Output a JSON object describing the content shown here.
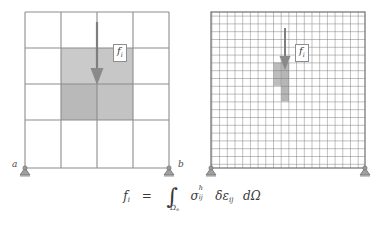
{
  "figure": {
    "panels": [
      {
        "id": "coarse",
        "name": "coarse-mesh",
        "columns": 4,
        "rows": 4,
        "mesh_left": 25,
        "mesh_top": 12,
        "mesh_right": 169,
        "mesh_bottom": 168,
        "grid_color": "#8c8c8c",
        "border_color": "#8c8c8c",
        "shaded_cells": [
          {
            "col": 1,
            "row": 1,
            "fill": "#c9c9c9"
          },
          {
            "col": 2,
            "row": 1,
            "fill": "#c9c9c9"
          },
          {
            "col": 1,
            "row": 2,
            "fill": "#b8b8b8"
          },
          {
            "col": 2,
            "row": 2,
            "fill": "#c2c2c2"
          }
        ],
        "arrow": {
          "x": 97,
          "y_start": 22,
          "y_end": 84,
          "color": "#7c7c7c",
          "head_width": 13,
          "head_length": 16
        },
        "force_label": "f",
        "force_subscript": "i",
        "force_label_x": 113,
        "force_label_y": 48,
        "supports": [
          {
            "label": "a",
            "x": 25,
            "y": 168
          },
          {
            "label": "b",
            "x": 169,
            "y": 168
          }
        ]
      },
      {
        "id": "fine",
        "name": "fine-mesh",
        "columns": 20,
        "rows": 20,
        "mesh_left": 211,
        "mesh_top": 12,
        "mesh_right": 365,
        "mesh_bottom": 168,
        "grid_color": "#6e6e6e",
        "border_color": "#6e6e6e",
        "shaded_cells": [
          {
            "col": 10,
            "row": 5,
            "fill": "#b4b4b4"
          },
          {
            "col": 10,
            "row": 6,
            "fill": "#b4b4b4"
          },
          {
            "col": 10,
            "row": 7,
            "fill": "#b4b4b4"
          },
          {
            "col": 10,
            "row": 8,
            "fill": "#b4b4b4"
          },
          {
            "col": 10,
            "row": 9,
            "fill": "#b4b4b4"
          }
        ],
        "arrow": {
          "x": 288,
          "y_start": 28,
          "y_end": 74,
          "color": "#7c7c7c",
          "head_width": 11,
          "head_length": 13
        },
        "force_label": "f",
        "force_subscript": "i",
        "force_label_x": 298,
        "force_label_y": 50,
        "supports": [
          {
            "label": "",
            "x": 211,
            "y": 168
          },
          {
            "label": "",
            "x": 365,
            "y": 168
          }
        ]
      }
    ],
    "node_labels": {
      "a": "a",
      "b": "b"
    },
    "support_color": "#9a9a9a",
    "support_outline": "#6f6f6f",
    "equation": {
      "lhs_symbol": "f",
      "lhs_subscript": "i",
      "equals": "=",
      "integral_symbol": "∫",
      "integral_domain": "Ω",
      "integral_domain_subscript": "e",
      "stress_symbol": "σ",
      "stress_superscript": "h",
      "stress_subscript": "ij",
      "variation_symbol": "δ",
      "strain_symbol": "ε",
      "strain_subscript": "ij",
      "differential": "d",
      "measure_symbol": "Ω",
      "plain_text": "f_i = ∫_Ωe σ^h_ij δε_ij dΩ"
    }
  }
}
